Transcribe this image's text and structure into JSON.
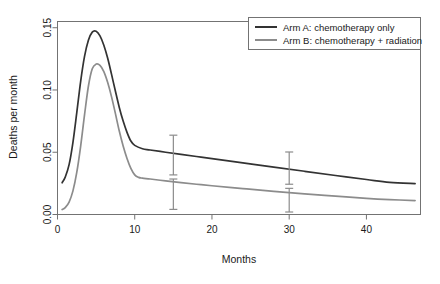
{
  "chart_data": {
    "type": "line",
    "title": "",
    "xlabel": "Months",
    "ylabel": "Deaths per month",
    "xlim": [
      0,
      47
    ],
    "ylim": [
      0,
      0.155
    ],
    "grid": false,
    "legend_position": "top-right",
    "xticks": [
      0,
      10,
      20,
      30,
      40
    ],
    "xtick_labels": [
      "0",
      "10",
      "20",
      "30",
      "40"
    ],
    "yticks": [
      0.0,
      0.05,
      0.1,
      0.15
    ],
    "ytick_labels": [
      "0.00",
      "0.05",
      "0.10",
      "0.15"
    ],
    "series": [
      {
        "name": "Arm A: chemotherapy only",
        "color": "#333333",
        "x": [
          0.6,
          1,
          1.5,
          2,
          2.5,
          3,
          3.5,
          4,
          4.5,
          5,
          5.5,
          6,
          6.5,
          7,
          7.5,
          8,
          8.5,
          9,
          9.5,
          10,
          11,
          12,
          14,
          16,
          18,
          20,
          24,
          28,
          32,
          36,
          40,
          43,
          46.3
        ],
        "y": [
          0.0255,
          0.03,
          0.04,
          0.058,
          0.082,
          0.107,
          0.127,
          0.14,
          0.1465,
          0.1472,
          0.1435,
          0.136,
          0.1255,
          0.1125,
          0.099,
          0.086,
          0.075,
          0.066,
          0.059,
          0.0555,
          0.0528,
          0.0518,
          0.05,
          0.0483,
          0.0466,
          0.0449,
          0.0415,
          0.0381,
          0.0347,
          0.0313,
          0.0281,
          0.0258,
          0.0248
        ]
      },
      {
        "name": "Arm B: chemotherapy + radiation",
        "color": "#8c8c8c",
        "x": [
          0.6,
          1,
          1.5,
          2,
          2.5,
          3,
          3.5,
          4,
          4.5,
          5,
          5.5,
          6,
          6.5,
          7,
          7.5,
          8,
          8.5,
          9,
          9.5,
          10,
          10.5,
          11,
          12,
          14,
          16,
          18,
          20,
          24,
          28,
          32,
          36,
          40,
          43,
          46.3
        ],
        "y": [
          0.004,
          0.0055,
          0.01,
          0.019,
          0.034,
          0.055,
          0.08,
          0.103,
          0.117,
          0.1208,
          0.1198,
          0.1148,
          0.106,
          0.0945,
          0.081,
          0.067,
          0.055,
          0.045,
          0.037,
          0.0318,
          0.0298,
          0.0292,
          0.0285,
          0.027,
          0.0256,
          0.0243,
          0.0231,
          0.0208,
          0.0186,
          0.0166,
          0.0147,
          0.013,
          0.012,
          0.0112
        ]
      }
    ],
    "error_bars": [
      {
        "series": "Arm A: chemotherapy only",
        "x": 15,
        "y": 0.0491,
        "low": 0.0318,
        "high": 0.0637,
        "color": "#8c8c8c"
      },
      {
        "series": "Arm B: chemotherapy + radiation",
        "x": 15,
        "y": 0.0263,
        "low": 0.0041,
        "high": 0.0285,
        "color": "#8c8c8c"
      },
      {
        "series": "Arm A: chemotherapy only",
        "x": 30,
        "y": 0.0372,
        "low": 0.0243,
        "high": 0.0502,
        "color": "#8c8c8c"
      },
      {
        "series": "Arm B: chemotherapy + radiation",
        "x": 30,
        "y": 0.018,
        "low": 0.002,
        "high": 0.021,
        "color": "#8c8c8c"
      }
    ]
  },
  "legend": {
    "entries": [
      {
        "label": "Arm A: chemotherapy only"
      },
      {
        "label": "Arm B: chemotherapy + radiation"
      }
    ]
  },
  "axes": {
    "x_title": "Months",
    "y_title": "Deaths per month"
  },
  "colors": {
    "arm_a": "#333333",
    "arm_b": "#8c8c8c",
    "frame": "#737373",
    "background": "#ffffff"
  }
}
